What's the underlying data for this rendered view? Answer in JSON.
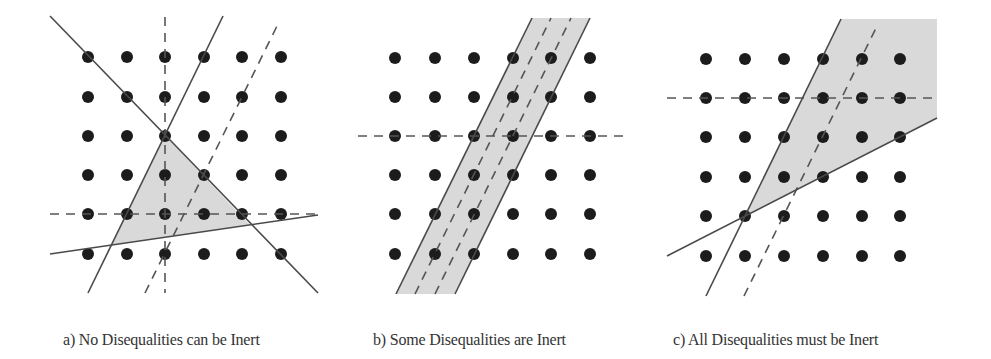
{
  "figure": {
    "panels": [
      {
        "id": "a",
        "caption": "a) No Disequalities can be Inert",
        "caption_x": 63,
        "dots": {
          "xs": [
            88,
            127,
            165,
            204,
            242,
            281
          ],
          "ys": [
            57,
            97,
            136,
            175,
            214,
            254
          ]
        },
        "shaded_region": [
          [
            165,
            136
          ],
          [
            250,
            225
          ],
          [
            112,
            245
          ]
        ],
        "solid_lines": [
          [
            [
              50,
              16
            ],
            [
              318,
              293
            ]
          ],
          [
            [
              88,
              293
            ],
            [
              223,
              16
            ]
          ],
          [
            [
              50,
              254
            ],
            [
              318,
              215
            ]
          ]
        ],
        "dashed_lines": [
          [
            [
              165,
              17
            ],
            [
              165,
              293
            ]
          ],
          [
            [
              50,
              214
            ],
            [
              318,
              214
            ]
          ],
          [
            [
              145,
              293
            ],
            [
              279,
              22
            ]
          ]
        ]
      },
      {
        "id": "b",
        "caption": "b) Some Disequalities are Inert",
        "caption_x": 373,
        "dots": {
          "xs": [
            395,
            435,
            474,
            513,
            551,
            590
          ],
          "ys": [
            58,
            97,
            136,
            175,
            214,
            254
          ]
        },
        "shaded_region": [
          [
            532,
            18
          ],
          [
            590,
            18
          ],
          [
            455,
            294
          ],
          [
            396,
            294
          ]
        ],
        "solid_lines": [
          [
            [
              396,
              294
            ],
            [
              532,
              18
            ]
          ],
          [
            [
              455,
              294
            ],
            [
              590,
              18
            ]
          ]
        ],
        "dashed_lines": [
          [
            [
              358,
              136
            ],
            [
              628,
              136
            ]
          ],
          [
            [
              415,
              294
            ],
            [
              551,
              18
            ]
          ],
          [
            [
              435,
              294
            ],
            [
              571,
              18
            ]
          ]
        ]
      },
      {
        "id": "c",
        "caption": "c) All Disequalities must be Inert",
        "caption_x": 673,
        "dots": {
          "xs": [
            706,
            745,
            784,
            823,
            862,
            900
          ],
          "ys": [
            59,
            98,
            137,
            177,
            216,
            256
          ]
        },
        "shaded_region": [
          [
            745,
            217
          ],
          [
            841,
            19
          ],
          [
            937,
            19
          ],
          [
            937,
            118
          ]
        ],
        "solid_lines": [
          [
            [
              706,
              296
            ],
            [
              841,
              19
            ]
          ],
          [
            [
              667,
              256
            ],
            [
              937,
              118
            ]
          ]
        ],
        "dashed_lines": [
          [
            [
              667,
              98
            ],
            [
              937,
              98
            ]
          ],
          [
            [
              744,
              296
            ],
            [
              878,
              24
            ]
          ]
        ]
      }
    ],
    "colors": {
      "dot": "#1c1c1c",
      "line": "#4a4a4a",
      "dash": "#555555",
      "shade": "#d9d9d9"
    }
  }
}
